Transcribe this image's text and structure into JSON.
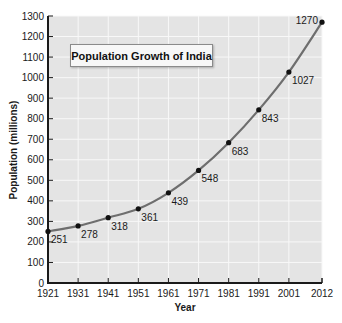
{
  "chart_data": {
    "type": "line",
    "title": "Population Growth of India",
    "xlabel": "Year",
    "ylabel": "Population (millions)",
    "categories": [
      "1921",
      "1931",
      "1941",
      "1951",
      "1961",
      "1971",
      "1981",
      "1991",
      "2001",
      "2012"
    ],
    "x": [
      1921,
      1931,
      1941,
      1951,
      1961,
      1971,
      1981,
      1991,
      2001,
      2012
    ],
    "series": [
      {
        "name": "Population (millions)",
        "values": [
          251,
          278,
          318,
          361,
          439,
          548,
          683,
          843,
          1027,
          1270
        ]
      }
    ],
    "data_labels": [
      "251",
      "278",
      "318",
      "361",
      "439",
      "548",
      "683",
      "843",
      "1027",
      "1270"
    ],
    "ylim": [
      0,
      1300
    ],
    "yticks": [
      0,
      100,
      200,
      300,
      400,
      500,
      600,
      700,
      800,
      900,
      1000,
      1100,
      1200,
      1300
    ],
    "ytick_labels": [
      "0",
      "100",
      "200",
      "300",
      "400",
      "500",
      "600",
      "700",
      "800",
      "900",
      "1000",
      "1100",
      "1200",
      "1300"
    ],
    "grid": true,
    "legend": "none",
    "colors": {
      "plot_background": "#e4e4e4",
      "grid": "#f8f8f8",
      "line": "#6e6e6e",
      "marker": "#111111",
      "axis": "#1a1a1a"
    }
  }
}
